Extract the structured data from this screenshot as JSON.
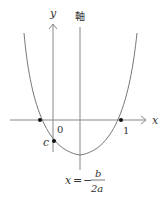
{
  "diagram": {
    "type": "parabola-graph",
    "labels": {
      "y_axis": "y",
      "x_axis": "x",
      "axis_of_symmetry": "軸",
      "origin": "0",
      "root_right": "1",
      "intercept": "c"
    },
    "formula": {
      "lhs": "x",
      "equals": "=",
      "sign": "−",
      "numerator": "b",
      "denominator": "2a"
    },
    "colors": {
      "stroke": "#888888",
      "text": "#333333",
      "point": "#111111"
    }
  }
}
